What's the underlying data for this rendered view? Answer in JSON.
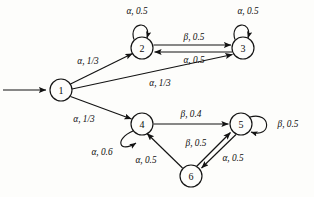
{
  "diagram": {
    "type": "finite-state-machine",
    "title": "",
    "states": [
      {
        "id": "1",
        "label": "1",
        "cx": 61,
        "cy": 90,
        "r": 11
      },
      {
        "id": "2",
        "label": "2",
        "cx": 142,
        "cy": 48,
        "r": 11
      },
      {
        "id": "3",
        "label": "3",
        "cx": 243,
        "cy": 48,
        "r": 11
      },
      {
        "id": "4",
        "label": "4",
        "cx": 142,
        "cy": 124,
        "r": 11
      },
      {
        "id": "5",
        "label": "5",
        "cx": 241,
        "cy": 124,
        "r": 11
      },
      {
        "id": "6",
        "label": "6",
        "cx": 191,
        "cy": 176,
        "r": 11
      }
    ],
    "start_arrow": {
      "from_x": 3,
      "to_x": 48,
      "y": 90
    },
    "transitions": [
      {
        "id": "t1-2",
        "from": "1",
        "to": "2",
        "symbol": "α",
        "weight": "1/3",
        "label": "α, 1/3",
        "label_x": 88,
        "label_y": 61
      },
      {
        "id": "t1-3",
        "from": "1",
        "to": "3",
        "symbol": "α",
        "weight": "1/3",
        "label": "α, 1/3",
        "label_x": 160,
        "label_y": 83
      },
      {
        "id": "t1-4",
        "from": "1",
        "to": "4",
        "symbol": "α",
        "weight": "1/3",
        "label": "α, 1/3",
        "label_x": 84,
        "label_y": 119
      },
      {
        "id": "t2-2",
        "from": "2",
        "to": "2",
        "symbol": "α",
        "weight": "0.5",
        "label": "α, 0.5",
        "label_x": 137,
        "label_y": 11
      },
      {
        "id": "t2-3",
        "from": "2",
        "to": "3",
        "symbol": "β",
        "weight": "0.5",
        "label": "β, 0.5",
        "label_x": 194,
        "label_y": 37
      },
      {
        "id": "t3-2",
        "from": "3",
        "to": "2",
        "symbol": "α",
        "weight": "0.5",
        "label": "α, 0.5",
        "label_x": 194,
        "label_y": 60
      },
      {
        "id": "t3-3",
        "from": "3",
        "to": "3",
        "symbol": "α",
        "weight": "0.5",
        "label": "α, 0.5",
        "label_x": 248,
        "label_y": 11
      },
      {
        "id": "t4-4",
        "from": "4",
        "to": "4",
        "symbol": "α",
        "weight": "0.6",
        "label": "α, 0.6",
        "label_x": 102,
        "label_y": 152
      },
      {
        "id": "t4-5",
        "from": "4",
        "to": "5",
        "symbol": "β",
        "weight": "0.4",
        "label": "β, 0.4",
        "label_x": 191,
        "label_y": 114
      },
      {
        "id": "t5-5",
        "from": "5",
        "to": "5",
        "symbol": "β",
        "weight": "0.5",
        "label": "β, 0.5",
        "label_x": 288,
        "label_y": 124
      },
      {
        "id": "t5-6",
        "from": "5",
        "to": "6",
        "symbol": "α",
        "weight": "0.5",
        "label": "α, 0.5",
        "label_x": 233,
        "label_y": 158
      },
      {
        "id": "t6-5",
        "from": "6",
        "to": "5",
        "symbol": "β",
        "weight": "0.5",
        "label": "β, 0.5",
        "label_x": 196,
        "label_y": 143
      },
      {
        "id": "t6-4",
        "from": "6",
        "to": "4",
        "symbol": "α",
        "weight": "0.5",
        "label": "α, 0.5",
        "label_x": 146,
        "label_y": 160
      }
    ],
    "colors": {
      "stroke": "#131313",
      "text": "#0d0d0d",
      "background": "#fdfdfb",
      "node_fill": "#fdfdfb"
    }
  }
}
